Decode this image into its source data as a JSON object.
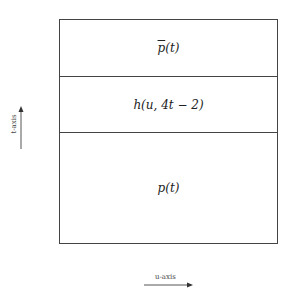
{
  "diagram": {
    "regions": [
      {
        "label_main": "p",
        "label_arg": "(t)",
        "overline": true
      },
      {
        "label": "h(u, 4t − 2)"
      },
      {
        "label_main": "p",
        "label_arg": "(t)",
        "overline": false
      }
    ],
    "axes": {
      "vertical_label": "t-axis",
      "horizontal_label": "u-axis"
    },
    "colors": {
      "line": "#444444",
      "background": "#ffffff"
    }
  }
}
